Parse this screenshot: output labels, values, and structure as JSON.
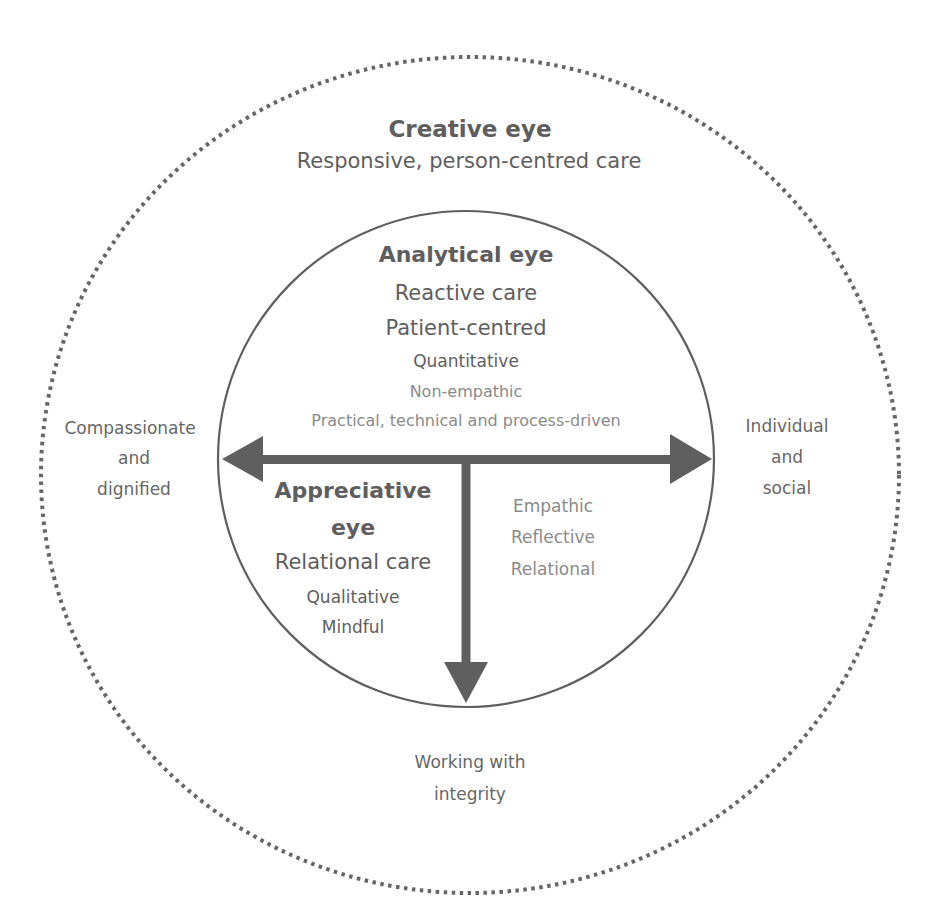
{
  "colors": {
    "line": "#5f5f5f",
    "dash": "#666666",
    "text_dark": "#5e5e5e",
    "text_mid": "#666666",
    "text_light": "#8a8a8a",
    "background": "#ffffff"
  },
  "outer_ring": {
    "title": "Creative eye",
    "subtitle": "Responsive, person-centred care"
  },
  "inner_circle": {
    "top": {
      "title": "Analytical eye",
      "lines": [
        "Reactive care",
        "Patient-centred",
        "Quantitative",
        "Non-empathic",
        "Practical, technical and process-driven"
      ]
    },
    "bottom_left": {
      "title_line1": "Appreciative",
      "title_line2": "eye",
      "lines": [
        "Relational care",
        "Qualitative",
        "Mindful"
      ]
    },
    "bottom_right": {
      "lines": [
        "Empathic",
        "Reflective",
        "Relational"
      ]
    }
  },
  "axis_labels": {
    "left": [
      "Compassionate",
      "and",
      "dignified"
    ],
    "right": [
      "Individual",
      "and",
      "social"
    ],
    "bottom": [
      "Working with",
      "integrity"
    ]
  },
  "icons": {
    "left_arrow": "arrow-left-icon",
    "right_arrow": "arrow-right-icon",
    "down_arrow": "arrow-down-icon"
  }
}
